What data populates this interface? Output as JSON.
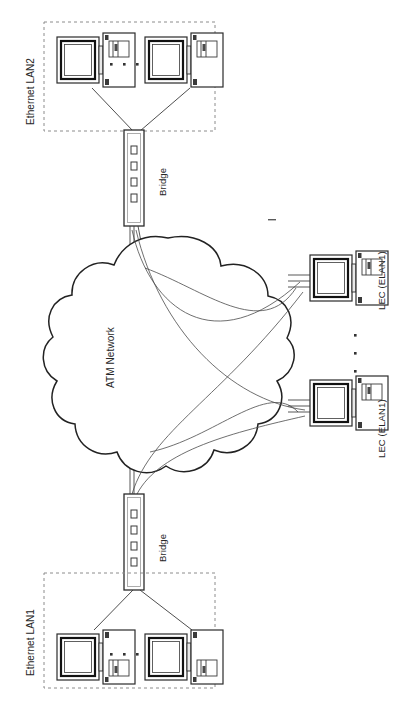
{
  "diagram": {
    "orientation": "rotated-90-ccw",
    "background_color": "#ffffff",
    "line_color": "#333333",
    "dashed_color": "#888888",
    "labels": {
      "ethernet_lan2": "Ethernet LAN2",
      "ethernet_lan1": "Ethernet LAN1",
      "bridge_top": "Bridge",
      "bridge_bottom": "Bridge",
      "atm_network": "ATM Network",
      "lec_upper": "LEC (ELAN1)",
      "lec_lower": "LEC (ELAN1)"
    },
    "groups": [
      {
        "id": "ethernet-lan2",
        "label": "Ethernet LAN2",
        "style": "dashed-box",
        "hosts": 2,
        "ellipsis": "• • •"
      },
      {
        "id": "ethernet-lan1",
        "label": "Ethernet LAN1",
        "style": "dashed-box",
        "hosts": 2,
        "ellipsis": "• • •"
      }
    ],
    "nodes": [
      {
        "id": "bridge-top",
        "type": "bridge",
        "label": "Bridge",
        "ports": 4
      },
      {
        "id": "bridge-bottom",
        "type": "bridge",
        "label": "Bridge",
        "ports": 4
      },
      {
        "id": "cloud-atm",
        "type": "cloud",
        "label": "ATM Network"
      },
      {
        "id": "lec-1",
        "type": "workstation",
        "label": "LEC (ELAN1)"
      },
      {
        "id": "lec-2",
        "type": "workstation",
        "label": "LEC (ELAN1)"
      }
    ],
    "ellipsis_dots": "• • •",
    "links": [
      {
        "from": "bridge-top",
        "to": "cloud-atm"
      },
      {
        "from": "bridge-bottom",
        "to": "cloud-atm"
      },
      {
        "from": "cloud-atm",
        "to": "lec-1"
      },
      {
        "from": "cloud-atm",
        "to": "lec-2"
      },
      {
        "from": "bridge-top",
        "to": "lec-1"
      },
      {
        "from": "bridge-top",
        "to": "lec-2"
      },
      {
        "from": "bridge-bottom",
        "to": "lec-1"
      },
      {
        "from": "bridge-bottom",
        "to": "lec-2"
      }
    ]
  }
}
